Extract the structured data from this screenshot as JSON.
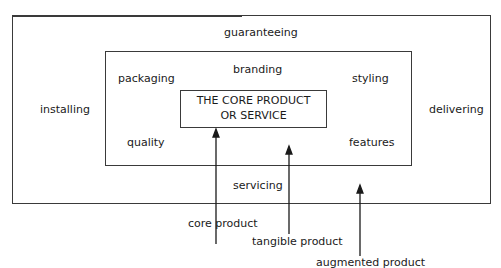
{
  "diagram": {
    "outer_box": {
      "labels": {
        "top": "guaranteeing",
        "left": "installing",
        "right": "delivering",
        "bottom": "servicing"
      }
    },
    "middle_box": {
      "labels": {
        "top": "branding",
        "top_left": "packaging",
        "top_right": "styling",
        "bottom_left": "quality",
        "bottom_right": "features"
      }
    },
    "inner_box": {
      "line1": "THE CORE PRODUCT",
      "line2": "OR SERVICE"
    },
    "pointers": [
      {
        "label": "core product",
        "target": "inner_box"
      },
      {
        "label": "tangible product",
        "target": "middle_box"
      },
      {
        "label": "augmented product",
        "target": "outer_box"
      }
    ]
  }
}
